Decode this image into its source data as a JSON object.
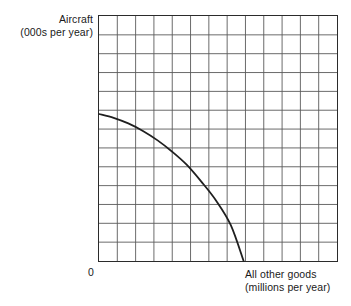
{
  "chart_data": {
    "type": "line",
    "title": "",
    "subtitle": "",
    "xlabel": "All other goods",
    "xlabel_units": "(millions per year)",
    "ylabel": "Aircraft",
    "ylabel_units": "(000s per year)",
    "origin_tick": "0",
    "grid": true,
    "grid_columns": 13,
    "grid_rows": 13,
    "xlim": [
      0,
      13
    ],
    "ylim": [
      0,
      13
    ],
    "xticks": [],
    "yticks": [],
    "legend": [],
    "annotations": [],
    "legend_position": "none",
    "series": [
      {
        "name": "Production possibility frontier",
        "curve_shape": "concave-to-origin",
        "color": "#1f1f1f",
        "x": [
          0.0,
          0.8,
          1.6,
          2.4,
          3.2,
          4.0,
          4.8,
          5.6,
          6.4,
          7.2,
          7.9
        ],
        "y": [
          7.8,
          7.6,
          7.3,
          6.9,
          6.4,
          5.8,
          5.1,
          4.2,
          3.2,
          1.9,
          0.0
        ]
      }
    ]
  },
  "labels": {
    "y_axis": {
      "line1": "Aircraft",
      "line2": "(000s per year)"
    },
    "x_axis": {
      "line1": "All other goods",
      "line2": "(millions per year)"
    },
    "origin": "0"
  },
  "colors": {
    "curve": "#1f1f1f",
    "grid_line": "#5a5a5a",
    "axis_border": "#2b2b2b",
    "background": "#ffffff",
    "text": "#1a1a1a"
  }
}
